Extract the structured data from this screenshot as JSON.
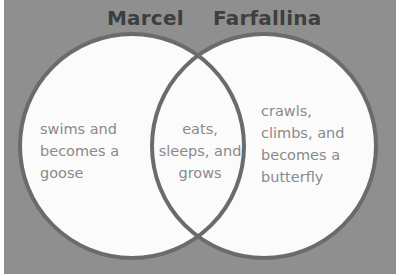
{
  "diagram": {
    "type": "venn",
    "colors": {
      "background": "#8f8f8f",
      "circle_fill": "#fbfbfb",
      "circle_stroke": "#6b6b6b",
      "title_text": "#3e3e3e",
      "body_text": "#8a8a8a"
    },
    "sets": [
      {
        "label": "Marcel",
        "only": "swims and\nbecomes a\ngoose"
      },
      {
        "label": "Farfallina",
        "only": "crawls,\nclimbs, and\nbecomes a\nbutterfly"
      }
    ],
    "intersection": "eats,\nsleeps, and\ngrows"
  }
}
